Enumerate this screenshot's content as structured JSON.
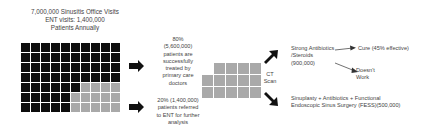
{
  "header": {
    "line1": "7,000,000 Sinusitis Office Visits",
    "line2": "ENT visits: 1,400,000",
    "line3": "Patients Annually"
  },
  "main_grid": {
    "rows": 7,
    "cols": 10,
    "cells": [
      [
        "black",
        "black",
        "black",
        "black",
        "black",
        "black",
        "black",
        "black",
        "black",
        "black"
      ],
      [
        "black",
        "black",
        "black",
        "black",
        "black",
        "black",
        "black",
        "black",
        "black",
        "black"
      ],
      [
        "black",
        "black",
        "black",
        "black",
        "black",
        "black",
        "black",
        "black",
        "black",
        "black"
      ],
      [
        "black",
        "black",
        "black",
        "black",
        "black",
        "black",
        "black",
        "black",
        "black",
        "black"
      ],
      [
        "black",
        "black",
        "black",
        "black",
        "black",
        "black",
        "gray",
        "gray",
        "gray",
        "gray"
      ],
      [
        "black",
        "black",
        "black",
        "black",
        "black",
        "gray",
        "gray",
        "gray",
        "gray",
        "gray"
      ],
      [
        "black",
        "black",
        "black",
        "black",
        "black",
        "gray",
        "gray",
        "gray",
        "gray",
        "gray"
      ]
    ],
    "colors": {
      "black": "#0d0d0d",
      "gray": "#a9a9a9"
    }
  },
  "primary_care": {
    "line1": "80%",
    "line2": "(5,600,000)",
    "line3": "patients are",
    "line4": "successfully",
    "line5": "treated by",
    "line6": "primary care",
    "line7": "doctors"
  },
  "ent_referral": {
    "line1": "20% (1,400,000)",
    "line2": "patients referred",
    "line3": "to ENT for further",
    "line4": "analysis"
  },
  "ent_grid": {
    "rows": [
      4,
      5,
      5
    ],
    "color": "#a9a9a9"
  },
  "ct_scan": {
    "line1": "CT",
    "line2": "Scan"
  },
  "antibiotics": {
    "line1": "Strong Antibiotics",
    "line2": "/Steroids",
    "line3": "(900,000)"
  },
  "cure": {
    "label": "Cure (45% effective)"
  },
  "doesnt_work": {
    "line1": "Doesn't",
    "line2": "Work"
  },
  "surgery": {
    "line1": "Sinuplasty + Antibiotics + Functional",
    "line2": "Endoscopic Sinus Surgery (FESS)(500,000)"
  }
}
